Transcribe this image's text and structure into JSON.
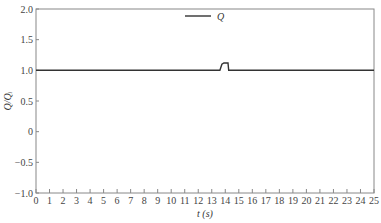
{
  "chart_data": {
    "type": "line",
    "title": "",
    "xlabel": "t (s)",
    "ylabel": "Q/Qᵢ",
    "xlim": [
      0,
      25
    ],
    "ylim": [
      -1.0,
      2.0
    ],
    "xticks": [
      0,
      1,
      2,
      3,
      4,
      5,
      6,
      7,
      8,
      9,
      10,
      11,
      12,
      13,
      14,
      15,
      16,
      17,
      18,
      19,
      20,
      21,
      22,
      23,
      24,
      25
    ],
    "yticks": [
      "2.0",
      "1.5",
      "1.0",
      "0.5",
      "0",
      "-0.5",
      "-1.0"
    ],
    "grid": false,
    "legend": {
      "position": "upper center",
      "entries": [
        "Q"
      ]
    },
    "series": [
      {
        "name": "Q",
        "color": "#333333",
        "x": [
          0,
          13.6,
          13.75,
          13.9,
          14.2,
          14.25,
          25
        ],
        "y": [
          1.0,
          1.0,
          1.1,
          1.12,
          1.12,
          1.0,
          1.0
        ]
      }
    ]
  }
}
